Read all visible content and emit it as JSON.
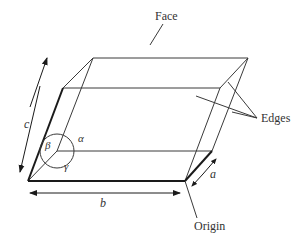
{
  "diagram": {
    "type": "unit-cell-parallelepiped",
    "labels": {
      "face": "Face",
      "edges": "Edges",
      "origin": "Origin",
      "a": "a",
      "b": "b",
      "c": "c",
      "alpha": "α",
      "beta": "β",
      "gamma": "γ"
    },
    "colors": {
      "line": "#3a3a3a",
      "bold_line": "#1a1a1a",
      "text": "#333333",
      "background": "#ffffff"
    }
  }
}
